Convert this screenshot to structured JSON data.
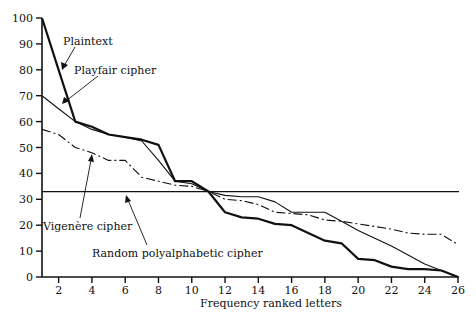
{
  "chart_data": {
    "type": "line",
    "title": "",
    "xlabel": "Frequency ranked letters",
    "ylabel": "",
    "xlim": [
      1,
      26
    ],
    "ylim": [
      0,
      100
    ],
    "grid": false,
    "x_ticks": [
      2,
      4,
      6,
      8,
      10,
      12,
      14,
      16,
      18,
      20,
      22,
      24,
      26
    ],
    "y_ticks": [
      0,
      10,
      20,
      30,
      40,
      50,
      60,
      70,
      80,
      90,
      100
    ],
    "x": [
      1,
      2,
      3,
      4,
      5,
      6,
      7,
      8,
      9,
      10,
      11,
      12,
      13,
      14,
      15,
      16,
      17,
      18,
      19,
      20,
      21,
      22,
      23,
      24,
      25,
      26
    ],
    "series": [
      {
        "name": "Plaintext",
        "style": "thick-solid",
        "values": [
          100,
          80,
          60,
          58,
          55,
          54,
          53,
          51,
          37,
          37,
          33,
          25,
          23,
          22.5,
          20.5,
          20,
          17,
          14,
          13,
          7,
          6.5,
          4,
          3,
          3,
          2.5,
          0
        ]
      },
      {
        "name": "Playfair cipher",
        "style": "thin-solid",
        "values": [
          70,
          65,
          60,
          57,
          55,
          54,
          52.5,
          45,
          37,
          36,
          33,
          31.5,
          31,
          31,
          29,
          25,
          25,
          25,
          21.5,
          18,
          15,
          12,
          8.5,
          5,
          2.5,
          0
        ]
      },
      {
        "name": "Vigenère cipher",
        "style": "dash-dot",
        "values": [
          57,
          55,
          50,
          48,
          45,
          45,
          38.5,
          37,
          35.5,
          35,
          33,
          30,
          29.5,
          28,
          25,
          24.5,
          24,
          22,
          21.5,
          20.5,
          19.5,
          18.5,
          17,
          16.5,
          16.5,
          12.5
        ]
      },
      {
        "name": "Random polyalphabetic cipher",
        "style": "thin-solid-flat",
        "values": [
          33,
          33,
          33,
          33,
          33,
          33,
          33,
          33,
          33,
          33,
          33,
          33,
          33,
          33,
          33,
          33,
          33,
          33,
          33,
          33,
          33,
          33,
          33,
          33,
          33,
          33
        ]
      }
    ],
    "annotations": [
      {
        "text": "Plaintext",
        "x": 2.9,
        "y": 92
      },
      {
        "text": "Playfair cipher",
        "x": 4.3,
        "y": 79
      },
      {
        "text": "Vigenère cipher",
        "x": 1.1,
        "y": 20
      },
      {
        "text": "Random polyalphabetic cipher",
        "x": 6.0,
        "y": 9
      }
    ]
  },
  "labels": {
    "plaintext": "Plaintext",
    "playfair": "Playfair cipher",
    "vigenere": "Vigenère cipher",
    "random": "Random polyalphabetic cipher",
    "xlabel": "Frequency ranked letters"
  }
}
